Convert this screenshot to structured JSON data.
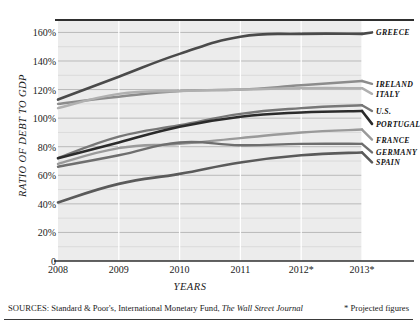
{
  "chart_data": {
    "type": "line",
    "title": "",
    "xlabel": "YEARS",
    "ylabel": "RATIO OF DEBT TO GDP",
    "x": [
      "2008",
      "2009",
      "2010",
      "2011",
      "2012*",
      "2013*"
    ],
    "xtick_labels": [
      "2008",
      "2009",
      "2010",
      "2011",
      "2012*",
      "2013*"
    ],
    "ytick_labels": [
      "0",
      "20%",
      "40%",
      "60%",
      "80%",
      "100%",
      "120%",
      "140%",
      "160%"
    ],
    "ytick_values": [
      0,
      20,
      40,
      60,
      80,
      100,
      120,
      140,
      160
    ],
    "ylim": [
      0,
      168
    ],
    "grid": "horizontal-major-and-minor",
    "legend_position": "right-inline-labels",
    "series": [
      {
        "name": "GREECE",
        "values": [
          113,
          129,
          145,
          157,
          159,
          159
        ],
        "color": "#4a4a4a",
        "width": 2.6,
        "label_y": 160
      },
      {
        "name": "IRELAND",
        "values": [
          110,
          115,
          119,
          120,
          123,
          126
        ],
        "color": "#8c8c8c",
        "width": 2.4,
        "label_y": 124
      },
      {
        "name": "ITALY",
        "values": [
          107,
          117,
          119,
          120,
          121,
          121
        ],
        "color": "#b0b0b0",
        "width": 2.4,
        "label_y": 117
      },
      {
        "name": "U.S.",
        "values": [
          72,
          87,
          95,
          103,
          107,
          109
        ],
        "color": "#777777",
        "width": 2.4,
        "label_y": 105
      },
      {
        "name": "PORTUGAL",
        "values": [
          72,
          83,
          94,
          101,
          104,
          105
        ],
        "color": "#2b2b2b",
        "width": 2.6,
        "label_y": 96
      },
      {
        "name": "FRANCE",
        "values": [
          68,
          79,
          82,
          86,
          90,
          92
        ],
        "color": "#9a9a9a",
        "width": 2.4,
        "label_y": 85
      },
      {
        "name": "GERMANY",
        "values": [
          66,
          74,
          83,
          81,
          82,
          82
        ],
        "color": "#6e6e6e",
        "width": 2.4,
        "label_y": 76
      },
      {
        "name": "SPAIN",
        "values": [
          41,
          54,
          61,
          69,
          74,
          76
        ],
        "color": "#5a5a5a",
        "width": 2.6,
        "label_y": 69
      }
    ]
  },
  "footer": {
    "sources_prefix": "SOURCES: Standard & Poor's, International Monetary Fund, ",
    "sources_italic": "The Wall Street Journal",
    "note": "* Projected figures"
  }
}
